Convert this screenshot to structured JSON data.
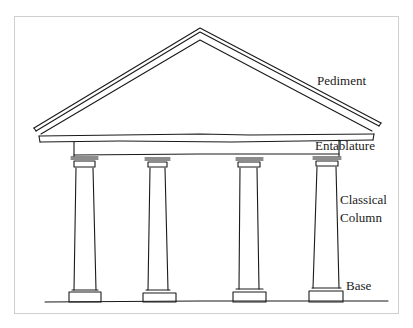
{
  "figure": {
    "labels": {
      "pediment": "Pediment",
      "entablature": "Entablature",
      "column_line1": "Classical",
      "column_line2": "Column",
      "base": "Base"
    },
    "column_count": 4,
    "colors": {
      "ink": "#1a1a1a",
      "frame_border": "#cfcfcf",
      "background": "#ffffff"
    },
    "caption": ""
  }
}
